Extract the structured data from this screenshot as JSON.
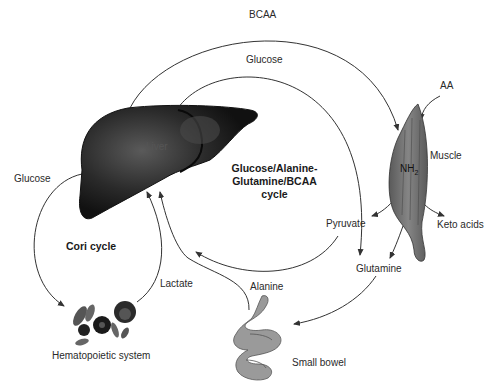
{
  "diagram": {
    "type": "metabolic-pathway",
    "organs": {
      "liver": "Liver",
      "muscle": "Muscle",
      "hematopoietic": "Hematopoietic system",
      "small_bowel": "Small bowel"
    },
    "cycles": {
      "cori": "Cori cycle",
      "gag_line1": "Glucose/Alanine-",
      "gag_line2": "Glutamine/BCAA",
      "gag_line3": "cycle"
    },
    "metabolites": {
      "bcaa": "BCAA",
      "glucose_top": "Glucose",
      "glucose_left": "Glucose",
      "aa": "AA",
      "nh2": "NH",
      "nh2_sub": "2",
      "pyruvate": "Pyruvate",
      "keto_acids": "Keto acids",
      "glutamine": "Glutamine",
      "alanine": "Alanine",
      "lactate": "Lactate"
    },
    "colors": {
      "liver": "#1b1b1b",
      "liver_highlight": "#555555",
      "muscle": "#6e6e6e",
      "bowel": "#9a9a9a",
      "arrow": "#333333"
    },
    "flows": [
      {
        "from": "Liver",
        "to": "Muscle",
        "label": "BCAA"
      },
      {
        "from": "Liver",
        "to": "Pyruvate",
        "label": "Glucose"
      },
      {
        "from": "AA",
        "to": "Muscle",
        "label": ""
      },
      {
        "from": "Muscle",
        "to": "Pyruvate",
        "label": ""
      },
      {
        "from": "Muscle",
        "to": "Keto acids",
        "label": ""
      },
      {
        "from": "Muscle",
        "to": "Glutamine",
        "label": ""
      },
      {
        "from": "Glutamine",
        "to": "Small bowel",
        "label": ""
      },
      {
        "from": "Pyruvate",
        "to": "Liver",
        "label": "Alanine"
      },
      {
        "from": "Small bowel",
        "to": "Liver",
        "label": "Alanine"
      },
      {
        "from": "Liver",
        "to": "Hematopoietic system",
        "label": "Glucose"
      },
      {
        "from": "Hematopoietic system",
        "to": "Liver",
        "label": "Lactate"
      }
    ]
  }
}
